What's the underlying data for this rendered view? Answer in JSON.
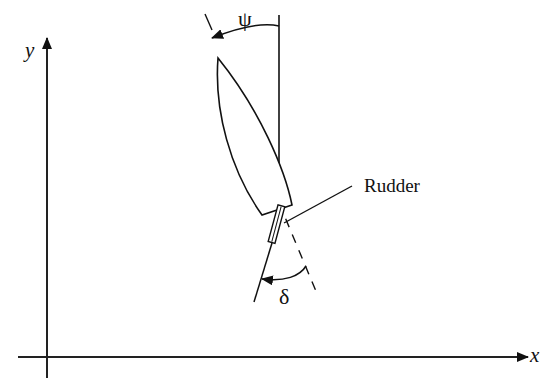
{
  "figure": {
    "axes": {
      "x_label": "x",
      "y_label": "y"
    },
    "angles": {
      "heading_symbol": "ψ",
      "rudder_symbol": "δ"
    },
    "callouts": {
      "rudder_label": "Rudder"
    },
    "colors": {
      "ink": "#111111",
      "background": "#ffffff"
    }
  }
}
